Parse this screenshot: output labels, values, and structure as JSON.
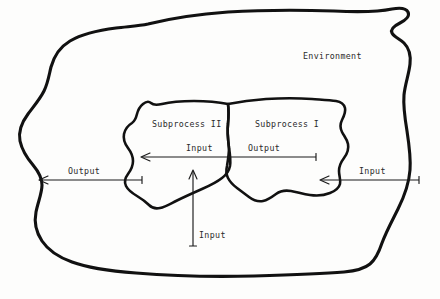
{
  "diagram": {
    "title_label": "Environment",
    "regions": [
      {
        "name": "environment",
        "label": "Environment"
      },
      {
        "name": "subprocess-2",
        "label": "Subprocess II"
      },
      {
        "name": "subprocess-1",
        "label": "Subprocess I"
      }
    ],
    "flows": [
      {
        "name": "output-left-external",
        "label": "Output",
        "direction": "left"
      },
      {
        "name": "input-middle",
        "label": "Input",
        "direction": "left"
      },
      {
        "name": "output-middle",
        "label": "Output",
        "direction": "left"
      },
      {
        "name": "input-right-external",
        "label": "Input",
        "direction": "left"
      },
      {
        "name": "input-bottom",
        "label": "Input",
        "direction": "up"
      }
    ],
    "labels": {
      "environment": "Environment",
      "subprocess_two": "Subprocess II",
      "subprocess_one": "Subprocess I",
      "output_left": "Output",
      "input_middle": "Input",
      "output_middle": "Output",
      "input_right": "Input",
      "input_bottom": "Input"
    },
    "colors": {
      "background": "#fdfdfc",
      "outline": "#111111",
      "arrow": "#1a1a1a",
      "text": "#2b2b2b"
    }
  }
}
